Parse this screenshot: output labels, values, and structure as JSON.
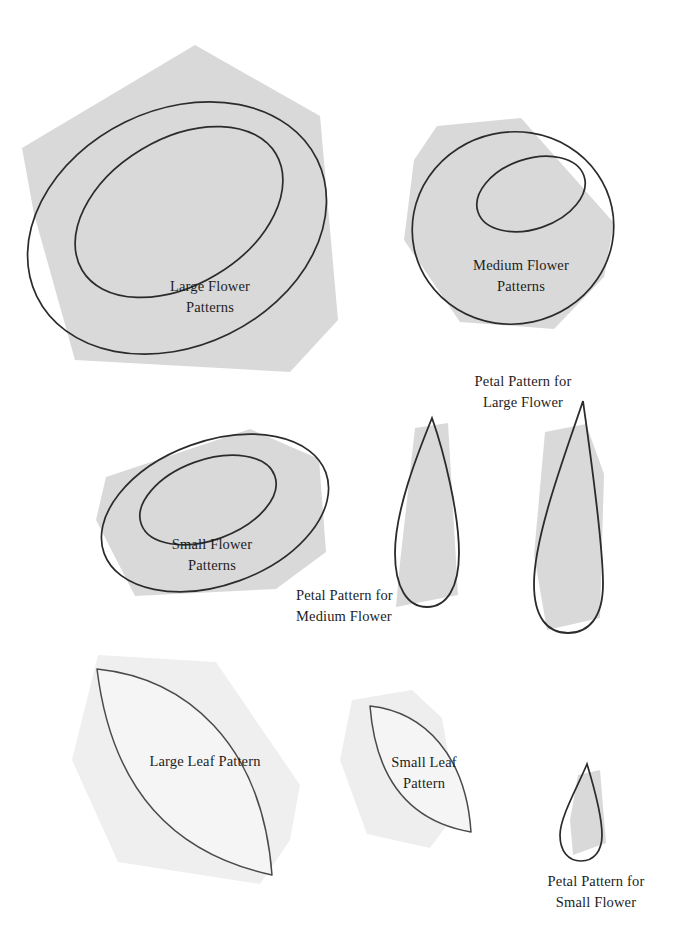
{
  "document": {
    "title": "Flower, Leaf and Petal Sewing Patterns",
    "background_color": "#ffffff",
    "paper_fill": "#d9d9d9",
    "leaf_fill": "#f4f4f4",
    "outline_color": "#2b2b2b",
    "text_color": "#1d1d1d"
  },
  "labels": {
    "large_flower": "Large Flower\nPatterns",
    "medium_flower": "Medium Flower\nPatterns",
    "small_flower": "Small Flower\nPatterns",
    "petal_large": "Petal Pattern for\nLarge Flower",
    "petal_medium": "Petal Pattern for\nMedium Flower",
    "petal_small": "Petal Pattern for\nSmall Flower",
    "large_leaf": "Large Leaf Pattern",
    "small_leaf": "Small Leaf\nPattern"
  },
  "pieces": [
    {
      "id": "large-flower",
      "name": "Large Flower Patterns",
      "kind": "flower",
      "size": "large",
      "rings": 2,
      "label": "Large Flower\nPatterns"
    },
    {
      "id": "medium-flower",
      "name": "Medium Flower Patterns",
      "kind": "flower",
      "size": "medium",
      "rings": 2,
      "label": "Medium Flower\nPatterns"
    },
    {
      "id": "small-flower",
      "name": "Small Flower Patterns",
      "kind": "flower",
      "size": "small",
      "rings": 2,
      "label": "Small Flower\nPatterns"
    },
    {
      "id": "large-petal",
      "name": "Petal Pattern for Large Flower",
      "kind": "petal",
      "size": "large",
      "label": "Petal Pattern for\nLarge Flower"
    },
    {
      "id": "medium-petal",
      "name": "Petal Pattern for Medium Flower",
      "kind": "petal",
      "size": "medium",
      "label": "Petal Pattern for\nMedium Flower"
    },
    {
      "id": "small-petal",
      "name": "Petal Pattern for Small Flower",
      "kind": "petal",
      "size": "small",
      "label": "Petal Pattern for\nSmall Flower"
    },
    {
      "id": "large-leaf",
      "name": "Large Leaf Pattern",
      "kind": "leaf",
      "size": "large",
      "label": "Large Leaf Pattern"
    },
    {
      "id": "small-leaf",
      "name": "Small Leaf Pattern",
      "kind": "leaf",
      "size": "small",
      "label": "Small Leaf\nPattern"
    }
  ]
}
